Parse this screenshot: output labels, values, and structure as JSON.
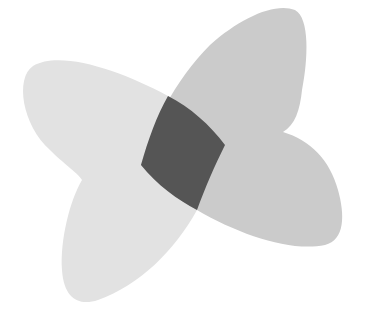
{
  "diagram": {
    "type": "overlapping-shapes",
    "description": "Two overlapping butterfly-wing shapes with a dark intersection region",
    "shapes": [
      {
        "id": "shape-left",
        "label": "",
        "lobes": [
          "upper-left",
          "lower-left"
        ],
        "fill": "#e2e2e2"
      },
      {
        "id": "shape-right",
        "label": "",
        "lobes": [
          "upper-right",
          "lower-right"
        ],
        "fill": "#cbcbcb"
      }
    ],
    "intersection": {
      "id": "overlap",
      "label": "",
      "fill": "#555555"
    },
    "background": "#ffffff"
  }
}
